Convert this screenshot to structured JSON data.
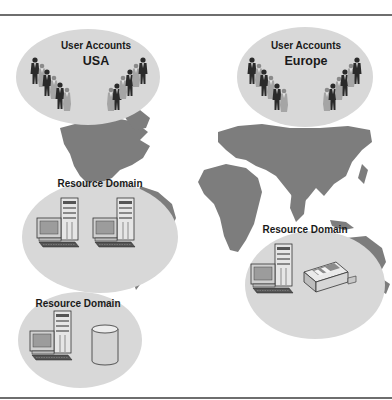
{
  "diagram": {
    "title": "",
    "colors": {
      "map": "#7d7d7d",
      "ellipse": "#d8d8d8",
      "person_dark": "#2a2a2a",
      "person_light": "#9a9a9a",
      "rule": "#6e6e6e"
    },
    "user_domains": [
      {
        "id": "usa",
        "line1": "User Accounts",
        "line2": "USA"
      },
      {
        "id": "europe",
        "line1": "User Accounts",
        "line2": "Europe"
      }
    ],
    "resource_domains": [
      {
        "id": "rd-americas",
        "label": "Resource Domain",
        "devices": [
          "workstation",
          "workstation"
        ]
      },
      {
        "id": "rd-asia",
        "label": "Resource Domain",
        "devices": [
          "workstation",
          "printer"
        ]
      },
      {
        "id": "rd-bottom",
        "label": "Resource Domain",
        "devices": [
          "workstation",
          "database"
        ]
      }
    ]
  }
}
